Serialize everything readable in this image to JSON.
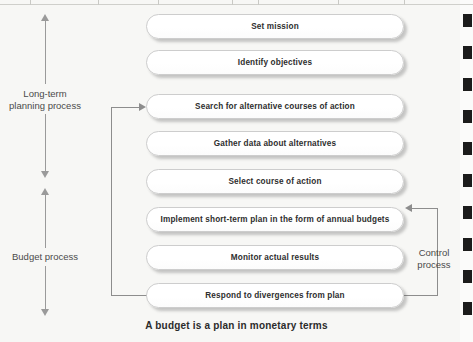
{
  "diagram": {
    "caption": "A budget is a plan in monetary terms",
    "background_color": "#f7f7f5",
    "box_border_color": "#cdcdcd",
    "connector_color": "#8d8d8d",
    "text_color": "#2e2e2e",
    "steps": [
      {
        "id": "set-mission",
        "label": "Set mission"
      },
      {
        "id": "identify-objectives",
        "label": "Identify objectives"
      },
      {
        "id": "search-alternatives",
        "label": "Search for alternative courses of action"
      },
      {
        "id": "gather-data",
        "label": "Gather data about alternatives"
      },
      {
        "id": "select-course",
        "label": "Select course of action"
      },
      {
        "id": "implement-plan",
        "label": "Implement short-term plan in the form of annual budgets"
      },
      {
        "id": "monitor-results",
        "label": "Monitor actual results"
      },
      {
        "id": "respond-divergences",
        "label": "Respond to divergences from plan"
      }
    ],
    "brackets": [
      {
        "id": "long-term-planning",
        "label": "Long-term\nplanning process"
      },
      {
        "id": "budget-process",
        "label": "Budget process"
      }
    ],
    "side_labels": [
      {
        "id": "control-process",
        "label": "Control\nprocess"
      }
    ]
  }
}
